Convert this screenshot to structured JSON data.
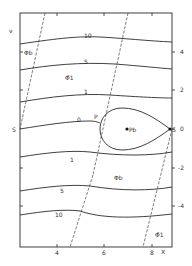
{
  "diagram": {
    "type": "contour-plot",
    "frame": {
      "left": 20,
      "right": 172,
      "top": 13,
      "bottom": 247
    },
    "axes": {
      "y_axis_label": "v",
      "x_axis_label": "X",
      "right_ticks": [
        {
          "label": "4",
          "y": 52
        },
        {
          "label": "2",
          "y": 90
        },
        {
          "label": "0",
          "y": 129
        },
        {
          "label": "-2",
          "y": 168
        },
        {
          "label": "-4",
          "y": 206
        }
      ],
      "bottom_ticks": [
        {
          "label": "4",
          "x": 57
        },
        {
          "label": "6",
          "x": 104
        },
        {
          "label": "8",
          "x": 152
        }
      ]
    },
    "contour_labels": [
      {
        "text": "10",
        "x": 84,
        "y": 38
      },
      {
        "text": "5",
        "x": 84,
        "y": 63
      },
      {
        "text": "1",
        "x": 84,
        "y": 94
      },
      {
        "text": "0",
        "x": 77,
        "y": 122
      },
      {
        "text": "1",
        "x": 70,
        "y": 161
      },
      {
        "text": "5",
        "x": 62,
        "y": 192
      },
      {
        "text": "10",
        "x": 56,
        "y": 216
      }
    ],
    "point_labels": {
      "phi_b_top_left": "Φb",
      "phi1_bar_top": "Φ̄1",
      "P": "P",
      "P_b": "Pb",
      "S_left": "S",
      "S_right": "S",
      "phi_b_lower": "Φb",
      "phi1_bar_bottom": "Φ̄1"
    },
    "colors": {
      "line": "#2a2a2a",
      "dashed": "#444444",
      "background": "#ffffff"
    }
  }
}
